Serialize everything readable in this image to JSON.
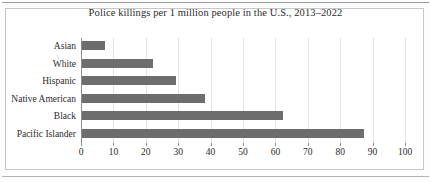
{
  "chart_data": {
    "type": "bar",
    "orientation": "horizontal",
    "title": "Police killings per 1 million people in the U.S., 2013–2022",
    "xlabel": "",
    "ylabel": "",
    "categories": [
      "Asian",
      "White",
      "Hispanic",
      "Native American",
      "Black",
      "Pacific Islander"
    ],
    "values": [
      7,
      22,
      29,
      38,
      62,
      87
    ],
    "xlim": [
      0,
      100
    ],
    "xticks": [
      0,
      10,
      20,
      30,
      40,
      50,
      60,
      70,
      80,
      90,
      100
    ],
    "xtick_labels": [
      "0",
      "10",
      "20",
      "30",
      "40",
      "50",
      "60",
      "70",
      "80",
      "90",
      "100"
    ],
    "grid": "vertical",
    "legend": "none",
    "bar_color": "#6d6d6d",
    "gridline_color": "#e2e2e2",
    "axis_color": "#8e8e8e",
    "text_color": "#2b2b2b",
    "border_color": "#c8c8c8",
    "background": "#ffffff",
    "artifact_mark": "\\"
  }
}
